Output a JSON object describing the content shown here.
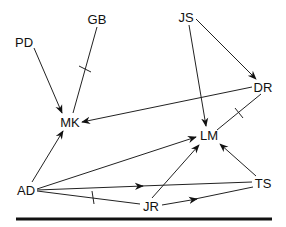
{
  "diagram": {
    "type": "directed-graph",
    "nodes": [
      {
        "id": "PD",
        "label": "PD",
        "x": 24,
        "y": 42
      },
      {
        "id": "GB",
        "label": "GB",
        "x": 97,
        "y": 19
      },
      {
        "id": "JS",
        "label": "JS",
        "x": 186,
        "y": 17
      },
      {
        "id": "DR",
        "label": "DR",
        "x": 262,
        "y": 87
      },
      {
        "id": "MK",
        "label": "MK",
        "x": 68,
        "y": 122
      },
      {
        "id": "LM",
        "label": "LM",
        "x": 208,
        "y": 135
      },
      {
        "id": "AD",
        "label": "AD",
        "x": 26,
        "y": 190
      },
      {
        "id": "JR",
        "label": "JR",
        "x": 150,
        "y": 206
      },
      {
        "id": "TS",
        "label": "TS",
        "x": 262,
        "y": 183
      }
    ],
    "edges": [
      {
        "from": "PD",
        "to": "MK",
        "arrow": true,
        "tick": false
      },
      {
        "from": "GB",
        "to": "MK",
        "arrow": false,
        "tick": true
      },
      {
        "from": "JS",
        "to": "DR",
        "arrow": true,
        "tick": false
      },
      {
        "from": "JS",
        "to": "LM",
        "arrow": true,
        "tick": false
      },
      {
        "from": "DR",
        "to": "MK",
        "arrow": true,
        "tick": false
      },
      {
        "from": "DR",
        "to": "LM",
        "arrow": false,
        "tick": true
      },
      {
        "from": "AD",
        "to": "MK",
        "arrow": true,
        "tick": false
      },
      {
        "from": "AD",
        "to": "LM",
        "arrow": true,
        "tick": false
      },
      {
        "from": "AD",
        "to": "TS",
        "arrow": true,
        "arrow_position": "mid",
        "tick": false
      },
      {
        "from": "AD",
        "to": "JR",
        "arrow": false,
        "tick": true
      },
      {
        "from": "JR",
        "to": "LM",
        "arrow": true,
        "tick": false
      },
      {
        "from": "JR",
        "to": "TS",
        "arrow": true,
        "arrow_position": "mid",
        "tick": false
      },
      {
        "from": "TS",
        "to": "LM",
        "arrow": true,
        "tick": false
      }
    ],
    "colors": {
      "line": "#222222",
      "text": "#111111",
      "background": "#ffffff"
    }
  }
}
